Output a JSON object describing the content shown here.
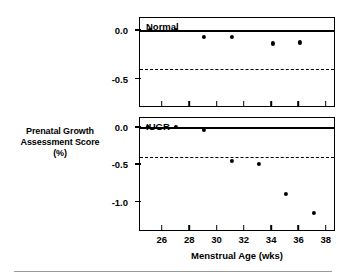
{
  "figure": {
    "y_axis_title_lines": [
      "Prenatal Growth",
      "Assessment Score",
      "(%)"
    ],
    "x_axis_title": "Menstrual Age (wks)"
  },
  "chart_data": {
    "type": "scatter",
    "title": "",
    "xlabel": "Menstrual Age (wks)",
    "ylabel": "Prenatal Growth Assessment Score (%)",
    "xlim": [
      24.4,
      38.6
    ],
    "xticks": [
      26,
      28,
      30,
      32,
      34,
      36,
      38
    ],
    "xticklabels": [
      "26",
      "28",
      "30",
      "32",
      "34",
      "36",
      "38"
    ],
    "grid": false,
    "legend": "none",
    "panels": [
      {
        "name": "normal-panel",
        "label": "Normal",
        "ylim": [
          -0.78,
          0.12
        ],
        "yticks": [
          0.0,
          -0.5
        ],
        "yticklabels": [
          "0.0",
          "-0.5"
        ],
        "reference_lines": [
          {
            "name": "zero-line",
            "value": 0.0,
            "style": "solid"
          },
          {
            "name": "cutoff-line",
            "value": -0.4,
            "style": "dashed"
          }
        ],
        "x": [
          25.1,
          27.0,
          29.1,
          31.1,
          34.1,
          36.1
        ],
        "y": [
          0.0,
          0.0,
          -0.07,
          -0.07,
          -0.14,
          -0.13
        ]
      },
      {
        "name": "iugr-panel",
        "label": "IUGR",
        "ylim": [
          -1.38,
          0.12
        ],
        "yticks": [
          0.0,
          -0.5,
          -1.0
        ],
        "yticklabels": [
          "0.0",
          "-0.5",
          "-1.0"
        ],
        "reference_lines": [
          {
            "name": "zero-line",
            "value": 0.0,
            "style": "solid"
          },
          {
            "name": "cutoff-line",
            "value": -0.4,
            "style": "dashed"
          }
        ],
        "x": [
          25.0,
          27.0,
          29.1,
          31.1,
          33.1,
          35.1,
          37.1
        ],
        "y": [
          0.0,
          0.0,
          -0.04,
          -0.45,
          -0.5,
          -0.9,
          -1.15
        ]
      }
    ]
  }
}
